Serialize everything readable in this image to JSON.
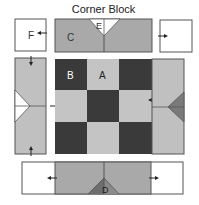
{
  "title": "Corner Block",
  "colors": {
    "dark": "#3a3a3a",
    "light": "#c4c4c4",
    "medium": "#a9a9a9",
    "triangle_dark": "#7a7a7a",
    "white": "#ffffff",
    "outline": "#555555"
  },
  "labels": {
    "A": "A",
    "B": "B",
    "C": "C",
    "D": "D",
    "E": "E",
    "F": "F"
  },
  "checkerboard": {
    "rows": 3,
    "cols": 3,
    "pattern": [
      [
        "dark",
        "light",
        "dark"
      ],
      [
        "light",
        "dark",
        "light"
      ],
      [
        "dark",
        "light",
        "dark"
      ]
    ]
  },
  "pieces": [
    {
      "id": "F",
      "description": "top-left white square"
    },
    {
      "id": "C",
      "description": "top strip with white E triangle"
    },
    {
      "id": "top-right-square",
      "description": "top-right white square"
    },
    {
      "id": "left-strip",
      "description": "left strip with white triangle"
    },
    {
      "id": "right-strip",
      "description": "right strip with dark triangle"
    },
    {
      "id": "D",
      "description": "bottom strip with dark D triangle"
    }
  ]
}
